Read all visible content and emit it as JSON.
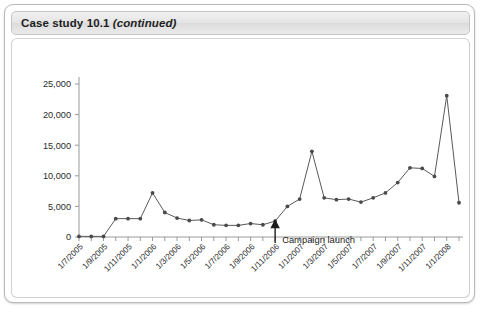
{
  "card": {
    "header": {
      "prefix": "Case study 10.1 ",
      "suffix": "(continued)"
    }
  },
  "chart_data": {
    "type": "line",
    "title": "",
    "xlabel": "",
    "ylabel": "",
    "ylim": [
      0,
      25000
    ],
    "ytick_labels": [
      "0",
      "5,000",
      "10,000",
      "15,000",
      "20,000",
      "25,000"
    ],
    "ytick_values": [
      0,
      5000,
      10000,
      15000,
      20000,
      25000
    ],
    "grid": false,
    "legend": "none",
    "xtick_labels": [
      "1/7/2005",
      "1/9/2005",
      "1/11/2005",
      "1/1/2006",
      "1/3/2006",
      "1/5/2006",
      "1/7/2006",
      "1/9/2006",
      "1/11/2006",
      "1/1/2007",
      "1/3/2007",
      "1/5/2007",
      "1/7/2007",
      "1/9/2007",
      "1/11/2007",
      "1/1/2008"
    ],
    "x": [
      "1/7/2005",
      "1/8/2005",
      "1/9/2005",
      "1/10/2005",
      "1/11/2005",
      "1/12/2005",
      "1/1/2006",
      "1/2/2006",
      "1/3/2006",
      "1/4/2006",
      "1/5/2006",
      "1/6/2006",
      "1/7/2006",
      "1/8/2006",
      "1/9/2006",
      "1/10/2006",
      "1/11/2006",
      "1/12/2006",
      "1/1/2007",
      "1/2/2007",
      "1/3/2007",
      "1/4/2007",
      "1/5/2007",
      "1/6/2007",
      "1/7/2007",
      "1/8/2007",
      "1/9/2007",
      "1/10/2007",
      "1/11/2007",
      "1/12/2007",
      "1/1/2008",
      "1/2/2008"
    ],
    "values": [
      100,
      100,
      100,
      3000,
      3000,
      3000,
      7200,
      4000,
      3100,
      2700,
      2800,
      2000,
      1900,
      1900,
      2200,
      2000,
      2600,
      5000,
      6200,
      14000,
      6400,
      6100,
      6200,
      5700,
      6400,
      7200,
      8900,
      11300,
      11200,
      9900,
      23100,
      5600
    ],
    "annotations": [
      {
        "text": "Campaign launch",
        "x": "1/11/2006",
        "y": 2600,
        "marker": "arrow-up"
      }
    ]
  }
}
